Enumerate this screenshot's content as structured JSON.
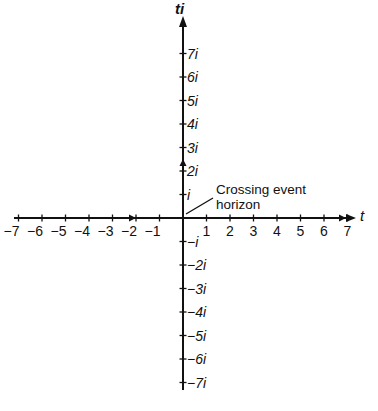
{
  "diagram": {
    "axes": {
      "horizontal_label": "t",
      "vertical_label": "ti",
      "horizontal_ticks": [
        "−7",
        "−6",
        "−5",
        "−4",
        "−3",
        "−2",
        "−1",
        "1",
        "2",
        "3",
        "4",
        "5",
        "6",
        "7"
      ],
      "horizontal_values": [
        -7,
        -6,
        -5,
        -4,
        -3,
        -2,
        -1,
        1,
        2,
        3,
        4,
        5,
        6,
        7
      ],
      "vertical_ticks_positive": [
        "i",
        "2i",
        "3i",
        "4i",
        "5i",
        "6i",
        "7i"
      ],
      "vertical_ticks_negative": [
        "−i",
        "−2i",
        "−3i",
        "−4i",
        "−5i",
        "−6i",
        "−7i"
      ]
    },
    "annotation": {
      "line1": "Crossing event",
      "line2": "horizon"
    },
    "markers": [
      {
        "axis": "t",
        "position": -2.5,
        "type": "arrow-right"
      },
      {
        "axis": "t",
        "position": 6.8,
        "type": "arrow-right"
      },
      {
        "axis": "ti",
        "position": 2.3,
        "type": "arrow-up"
      }
    ],
    "colors": {
      "line": "#111111",
      "background": "#ffffff"
    }
  }
}
